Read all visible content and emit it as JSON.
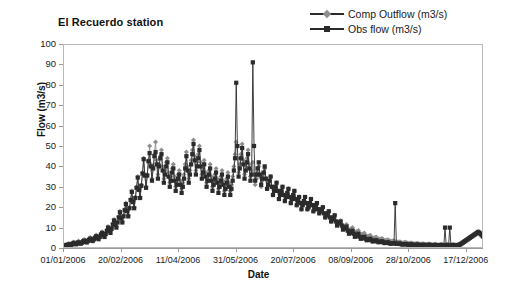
{
  "chart_data": {
    "type": "line",
    "title": "El Recuerdo station",
    "xlabel": "Date",
    "ylabel": "Flow (m3/s)",
    "ylim": [
      0,
      100
    ],
    "ytick_values": [
      0,
      10,
      20,
      30,
      40,
      50,
      60,
      70,
      80,
      90,
      100
    ],
    "ytick_labels": [
      "0",
      "10",
      "20",
      "30",
      "40",
      "50",
      "60",
      "70",
      "80",
      "90",
      "100"
    ],
    "xtick_labels": [
      "01/01/2006",
      "20/02/2006",
      "11/04/2006",
      "31/05/2006",
      "20/07/2006",
      "08/09/2006",
      "28/10/2006",
      "17/12/2006"
    ],
    "xtick_day_index": [
      0,
      50,
      100,
      150,
      200,
      250,
      300,
      350
    ],
    "x_range_days": [
      0,
      365
    ],
    "grid": false,
    "legend_position": "top-right",
    "colors": {
      "comp_outflow": "#8e8e8e",
      "obs_flow": "#2b2b2b",
      "axis": "#9a9a9a",
      "frame": "#b9b9b9",
      "background": "#ffffff"
    },
    "markers": {
      "comp_outflow": "diamond",
      "obs_flow": "square"
    },
    "series": [
      {
        "name": "Comp Outflow (m3/s)",
        "marker": "diamond",
        "color": "#8e8e8e",
        "values": [
          1.5,
          1.6,
          1.4,
          1.8,
          2.0,
          2.2,
          2.0,
          1.9,
          2.4,
          3.0,
          2.6,
          2.3,
          2.8,
          3.4,
          3.0,
          2.7,
          3.2,
          3.8,
          4.2,
          3.6,
          3.3,
          4.0,
          4.6,
          5.2,
          4.4,
          4.0,
          4.8,
          5.6,
          6.4,
          5.4,
          4.9,
          6.0,
          7.2,
          8.0,
          6.8,
          6.0,
          7.4,
          9.0,
          10.5,
          9.0,
          8.0,
          10.0,
          12.0,
          14.0,
          12.0,
          10.5,
          13.0,
          15.5,
          18.0,
          15.0,
          13.0,
          16.0,
          19.0,
          22.0,
          18.5,
          16.0,
          20.0,
          24.0,
          28.0,
          23.0,
          20.0,
          25.0,
          30.0,
          35.0,
          29.0,
          25.0,
          31.0,
          37.0,
          44.0,
          36.0,
          30.0,
          36.0,
          43.0,
          50.0,
          41.0,
          34.0,
          40.0,
          46.0,
          52.0,
          43.0,
          36.0,
          41.0,
          45.0,
          48.0,
          40.0,
          34.0,
          38.0,
          42.0,
          44.0,
          37.0,
          32.0,
          35.0,
          39.0,
          41.0,
          35.0,
          30.0,
          33.0,
          36.0,
          38.0,
          33.0,
          29.0,
          32.0,
          36.0,
          41.0,
          47.0,
          40.0,
          34.0,
          38.0,
          43.0,
          48.0,
          53.0,
          45.0,
          38.0,
          42.0,
          46.0,
          50.0,
          42.0,
          36.0,
          39.0,
          43.0,
          37.0,
          32.0,
          35.0,
          38.0,
          41.0,
          35.0,
          30.0,
          33.0,
          36.0,
          39.0,
          34.0,
          29.0,
          32.0,
          35.0,
          38.0,
          33.0,
          28.0,
          31.0,
          34.0,
          37.0,
          32.0,
          28.0,
          31.0,
          35.0,
          40.0,
          46.0,
          52.0,
          44.0,
          37.0,
          41.0,
          46.0,
          51.0,
          43.0,
          36.0,
          40.0,
          44.0,
          48.0,
          41.0,
          35.0,
          38.0,
          42.0,
          36.0,
          31.0,
          34.0,
          37.0,
          40.0,
          35.0,
          30.0,
          33.0,
          36.0,
          39.0,
          34.0,
          29.0,
          31.0,
          33.0,
          35.0,
          30.0,
          26.0,
          28.0,
          30.0,
          32.0,
          28.0,
          24.0,
          26.0,
          28.0,
          30.0,
          26.0,
          23.0,
          25.0,
          27.0,
          29.0,
          25.0,
          22.0,
          24.0,
          26.0,
          28.0,
          24.0,
          21.0,
          23.0,
          25.0,
          22.0,
          19.0,
          21.0,
          23.0,
          25.0,
          22.0,
          19.0,
          20.0,
          22.0,
          24.0,
          21.0,
          18.0,
          19.0,
          21.0,
          22.0,
          19.0,
          17.0,
          18.0,
          19.0,
          20.0,
          17.0,
          15.0,
          16.0,
          17.0,
          18.0,
          15.0,
          13.0,
          14.0,
          15.0,
          16.0,
          13.5,
          12.0,
          12.5,
          13.0,
          13.5,
          11.5,
          10.0,
          10.5,
          11.0,
          11.5,
          9.5,
          8.5,
          9.0,
          9.5,
          10.0,
          8.5,
          7.5,
          7.8,
          8.2,
          8.6,
          7.2,
          6.4,
          6.7,
          7.0,
          7.3,
          6.2,
          5.5,
          5.7,
          6.0,
          6.3,
          5.3,
          4.7,
          4.9,
          5.1,
          5.4,
          4.6,
          4.1,
          4.3,
          4.5,
          4.7,
          4.0,
          3.6,
          3.7,
          3.9,
          4.1,
          3.5,
          3.2,
          3.3,
          3.4,
          3.6,
          3.1,
          2.8,
          2.9,
          3.0,
          3.1,
          2.7,
          2.5,
          2.6,
          2.7,
          2.8,
          2.4,
          2.2,
          2.3,
          2.4,
          2.5,
          2.2,
          2.0,
          2.1,
          2.2,
          2.3,
          2.0,
          1.9,
          1.9,
          2.0,
          2.1,
          1.8,
          1.7,
          1.8,
          1.9,
          2.0,
          1.7,
          1.6,
          1.7,
          1.8,
          1.9,
          1.6,
          1.5,
          1.6,
          1.7,
          1.8,
          1.6,
          1.5,
          1.6,
          1.7,
          1.8,
          1.6,
          1.5,
          1.6,
          1.7,
          1.8,
          1.6,
          1.5,
          1.6,
          1.7,
          1.9,
          2.2,
          2.6,
          3.0,
          3.4,
          3.8,
          4.2,
          4.6,
          5.0,
          5.4,
          5.8,
          6.2,
          6.6,
          7.0,
          7.4,
          7.8,
          8.2,
          7.8,
          7.2,
          6.6,
          6.0
        ]
      },
      {
        "name": "Obs flow (m3/s)",
        "marker": "square",
        "color": "#2b2b2b",
        "values": [
          1.0,
          1.2,
          1.0,
          1.4,
          1.5,
          1.8,
          1.6,
          1.5,
          2.0,
          2.5,
          2.0,
          1.8,
          2.2,
          2.8,
          2.4,
          2.1,
          2.6,
          3.2,
          3.6,
          3.0,
          2.7,
          3.4,
          4.0,
          4.6,
          3.8,
          3.4,
          4.2,
          5.0,
          5.8,
          4.8,
          4.3,
          5.4,
          6.6,
          7.4,
          6.2,
          5.4,
          6.8,
          8.4,
          10.0,
          8.4,
          7.4,
          9.4,
          11.5,
          13.5,
          11.5,
          10.0,
          12.5,
          15.0,
          17.5,
          14.5,
          12.5,
          15.5,
          18.5,
          21.5,
          18.0,
          15.5,
          19.5,
          23.5,
          27.5,
          22.5,
          19.5,
          24.5,
          29.5,
          34.5,
          28.5,
          24.5,
          30.5,
          36.5,
          43.5,
          35.5,
          29.5,
          35.5,
          42.5,
          46.5,
          40.0,
          33.0,
          39.0,
          45.0,
          47.0,
          41.0,
          34.0,
          40.0,
          44.0,
          46.0,
          38.0,
          32.0,
          36.0,
          40.0,
          42.0,
          35.0,
          30.0,
          33.0,
          37.0,
          39.0,
          33.0,
          28.0,
          31.0,
          34.0,
          36.0,
          31.0,
          27.0,
          30.0,
          34.0,
          39.0,
          45.0,
          38.0,
          32.0,
          36.0,
          41.0,
          46.0,
          51.0,
          43.0,
          36.0,
          40.0,
          44.0,
          48.0,
          40.0,
          34.0,
          37.0,
          41.0,
          35.0,
          30.0,
          33.0,
          36.0,
          39.0,
          33.0,
          28.0,
          31.0,
          34.0,
          37.0,
          32.0,
          27.0,
          30.0,
          33.0,
          36.0,
          31.0,
          26.0,
          29.0,
          32.0,
          35.0,
          30.0,
          26.0,
          29.0,
          33.0,
          38.0,
          44.0,
          81.0,
          50.0,
          35.0,
          39.0,
          44.0,
          49.0,
          41.0,
          34.0,
          38.0,
          42.0,
          46.0,
          39.0,
          33.0,
          36.0,
          91.0,
          50.0,
          33.0,
          36.0,
          39.0,
          42.0,
          36.0,
          31.0,
          34.0,
          37.0,
          40.0,
          34.0,
          29.0,
          31.0,
          33.0,
          35.0,
          30.0,
          26.0,
          28.0,
          30.0,
          32.0,
          28.0,
          24.0,
          26.0,
          28.0,
          30.0,
          26.0,
          23.0,
          25.0,
          27.0,
          29.0,
          25.0,
          22.0,
          24.0,
          26.0,
          28.0,
          24.0,
          21.0,
          23.0,
          25.0,
          22.0,
          19.0,
          21.0,
          23.0,
          25.0,
          22.0,
          19.0,
          20.0,
          22.0,
          24.0,
          21.0,
          18.0,
          19.0,
          21.0,
          22.0,
          19.0,
          17.0,
          18.0,
          19.0,
          20.0,
          17.0,
          15.0,
          16.0,
          17.0,
          18.0,
          15.0,
          13.0,
          14.0,
          15.0,
          16.0,
          13.0,
          11.0,
          12.0,
          12.5,
          13.0,
          11.0,
          9.0,
          9.5,
          10.0,
          10.5,
          8.5,
          7.0,
          7.5,
          8.0,
          8.5,
          7.0,
          5.5,
          6.0,
          6.5,
          7.0,
          5.5,
          4.5,
          5.0,
          5.2,
          5.5,
          4.5,
          3.8,
          4.0,
          4.2,
          4.5,
          3.8,
          3.2,
          3.4,
          3.6,
          3.8,
          3.2,
          2.8,
          3.0,
          3.1,
          3.3,
          2.8,
          2.4,
          2.5,
          2.6,
          2.8,
          2.4,
          2.1,
          2.2,
          2.3,
          2.4,
          22.0,
          2.0,
          2.0,
          2.1,
          2.2,
          1.9,
          1.7,
          1.8,
          1.9,
          2.0,
          1.7,
          1.5,
          1.6,
          1.7,
          1.8,
          1.5,
          1.4,
          1.5,
          1.6,
          1.7,
          1.5,
          1.4,
          1.4,
          1.5,
          1.6,
          1.4,
          1.3,
          1.4,
          1.5,
          1.6,
          1.3,
          1.2,
          1.3,
          1.4,
          1.5,
          1.3,
          1.2,
          1.3,
          1.4,
          1.5,
          1.3,
          1.2,
          10.0,
          1.3,
          1.4,
          1.2,
          10.0,
          1.2,
          1.3,
          1.4,
          1.2,
          1.1,
          1.2,
          1.3,
          1.5,
          1.8,
          2.2,
          2.6,
          3.0,
          3.4,
          3.8,
          4.2,
          4.6,
          5.0,
          5.4,
          5.8,
          6.2,
          6.6,
          7.0,
          7.4,
          7.8,
          7.4,
          6.8,
          6.2,
          5.6
        ]
      }
    ]
  }
}
